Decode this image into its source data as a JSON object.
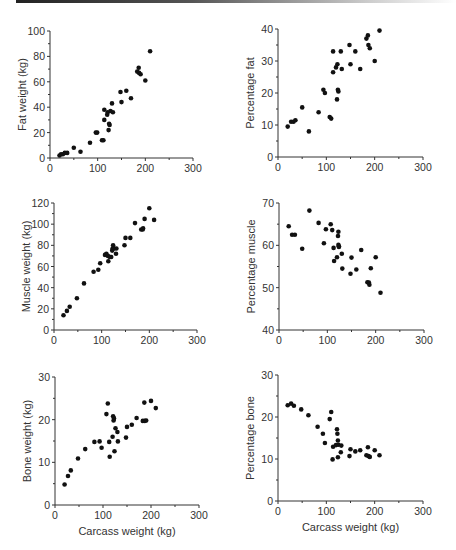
{
  "chart_data": [
    {
      "id": "fat-weight",
      "type": "scatter",
      "title": "",
      "xlabel": "",
      "ylabel": "Fat weight (kg)",
      "xlim": [
        0,
        300
      ],
      "ylim": [
        0,
        100
      ],
      "xticks": [
        0,
        100,
        200,
        300
      ],
      "yticks": [
        0,
        20,
        40,
        60,
        80,
        100
      ],
      "grid": false,
      "frame": {
        "x0": 50,
        "x1": 193,
        "y0": 158,
        "y1": 31
      },
      "x": [
        20,
        23,
        27,
        31,
        36,
        50,
        64,
        84,
        96,
        99,
        109,
        112,
        114,
        114,
        120,
        121,
        123,
        124,
        125,
        127,
        130,
        132,
        148,
        150,
        160,
        170,
        183,
        186,
        187,
        190,
        200,
        210
      ],
      "y": [
        2,
        3,
        3,
        4,
        4,
        8,
        5,
        12,
        20,
        20,
        14,
        14,
        38,
        30,
        34,
        36,
        22,
        27,
        26,
        37,
        43,
        36,
        52,
        44,
        53,
        47,
        68,
        71,
        67,
        66,
        61,
        84
      ]
    },
    {
      "id": "percentage-fat",
      "type": "scatter",
      "title": "",
      "xlabel": "",
      "ylabel": "Percentage fat",
      "xlim": [
        0,
        300
      ],
      "ylim": [
        0,
        40
      ],
      "xticks": [
        0,
        100,
        200,
        300
      ],
      "yticks": [
        0,
        10,
        20,
        30,
        40
      ],
      "grid": false,
      "frame": {
        "x0": 278,
        "x1": 423,
        "y0": 157,
        "y1": 29
      },
      "x": [
        20,
        27,
        32,
        36,
        50,
        64,
        84,
        94,
        97,
        107,
        110,
        114,
        114,
        120,
        122,
        123,
        124,
        125,
        130,
        132,
        148,
        150,
        160,
        170,
        183,
        186,
        187,
        190,
        200,
        210
      ],
      "y": [
        9.5,
        11,
        11,
        11.5,
        15.5,
        8,
        14,
        21,
        20,
        12.5,
        12,
        33,
        26.5,
        28,
        18,
        29,
        21,
        20.5,
        33,
        27.5,
        35,
        29,
        33,
        27.5,
        37,
        38,
        35,
        34,
        30,
        39.5
      ]
    },
    {
      "id": "muscle-weight",
      "type": "scatter",
      "title": "",
      "xlabel": "",
      "ylabel": "Muscle weight (kg)",
      "xlim": [
        0,
        300
      ],
      "ylim": [
        0,
        120
      ],
      "xticks": [
        0,
        100,
        200,
        300
      ],
      "yticks": [
        0,
        20,
        40,
        60,
        80,
        100,
        120
      ],
      "grid": false,
      "frame": {
        "x0": 54,
        "x1": 197,
        "y0": 330,
        "y1": 203
      },
      "x": [
        20,
        27,
        33,
        48,
        63,
        83,
        93,
        97,
        107,
        110,
        113,
        114,
        117,
        120,
        122,
        123,
        124,
        126,
        130,
        131,
        148,
        150,
        160,
        170,
        183,
        186,
        187,
        190,
        200,
        210
      ],
      "y": [
        14,
        18,
        22,
        30,
        44,
        55,
        57,
        63,
        71,
        72,
        70,
        65,
        69,
        69,
        75,
        77,
        80,
        77,
        72,
        77,
        80,
        87,
        87,
        101,
        95,
        95,
        96,
        105,
        115,
        104
      ]
    },
    {
      "id": "percentage-muscle",
      "type": "scatter",
      "title": "",
      "xlabel": "",
      "ylabel": "Percentage muscle",
      "xlim": [
        0,
        300
      ],
      "ylim": [
        40,
        70
      ],
      "xticks": [
        0,
        100,
        200,
        300
      ],
      "yticks": [
        40,
        50,
        60,
        70
      ],
      "grid": false,
      "frame": {
        "x0": 279,
        "x1": 424,
        "y0": 330,
        "y1": 203
      },
      "x": [
        20,
        27,
        33,
        48,
        63,
        82,
        93,
        97,
        107,
        110,
        113,
        114,
        120,
        122,
        123,
        123,
        124,
        124,
        130,
        131,
        148,
        150,
        160,
        170,
        183,
        186,
        187,
        190,
        200,
        210
      ],
      "y": [
        64.5,
        62.5,
        62.5,
        59.2,
        68.2,
        65.3,
        60.5,
        63.8,
        65,
        63.6,
        59.4,
        56.3,
        57.2,
        62.2,
        63.2,
        60.1,
        59.8,
        59.6,
        58,
        54.5,
        53.3,
        57.1,
        54.3,
        58.9,
        51.3,
        51.2,
        50.7,
        54.6,
        57.2,
        48.8
      ]
    },
    {
      "id": "bone-weight",
      "type": "scatter",
      "title": "",
      "xlabel": "Carcass weight (kg)",
      "ylabel": "Bone weight (kg)",
      "xlim": [
        0,
        300
      ],
      "ylim": [
        0,
        30
      ],
      "xticks": [
        0,
        100,
        200,
        300
      ],
      "yticks": [
        0,
        10,
        20,
        30
      ],
      "grid": false,
      "frame": {
        "x0": 55,
        "x1": 199,
        "y0": 505,
        "y1": 377
      },
      "x": [
        20,
        27,
        33,
        48,
        63,
        82,
        93,
        97,
        107,
        110,
        113,
        114,
        120,
        121,
        122,
        123,
        124,
        126,
        130,
        131,
        148,
        150,
        160,
        170,
        183,
        186,
        187,
        190,
        200,
        210
      ],
      "y": [
        4.8,
        6.8,
        8.1,
        10.9,
        13.1,
        14.8,
        14.9,
        13.4,
        21.3,
        23.8,
        14.8,
        11.3,
        16,
        20.8,
        19.8,
        20.3,
        12.6,
        18,
        17.1,
        14.9,
        15.8,
        18.3,
        18.8,
        20.4,
        19.7,
        24,
        19.7,
        19.8,
        24.4,
        22.7
      ]
    },
    {
      "id": "percentage-bone",
      "type": "scatter",
      "title": "",
      "xlabel": "Carcass weight (kg)",
      "ylabel": "Percentage bone",
      "xlim": [
        0,
        300
      ],
      "ylim": [
        0,
        30
      ],
      "xticks": [
        0,
        100,
        200,
        300
      ],
      "yticks": [
        0,
        10,
        20,
        30
      ],
      "grid": false,
      "frame": {
        "x0": 278,
        "x1": 423,
        "y0": 501,
        "y1": 375
      },
      "x": [
        20,
        27,
        33,
        48,
        63,
        82,
        93,
        97,
        107,
        110,
        113,
        114,
        120,
        122,
        123,
        124,
        124,
        125,
        130,
        131,
        148,
        150,
        160,
        170,
        183,
        186,
        187,
        190,
        200,
        210
      ],
      "y": [
        22.8,
        23.2,
        22.7,
        21.8,
        20.4,
        17.7,
        16,
        13.8,
        19.5,
        21.2,
        9.9,
        12.9,
        13.3,
        17.1,
        16,
        14.4,
        10.4,
        13.4,
        11.6,
        13.2,
        10.7,
        12.3,
        11.8,
        12.1,
        10.9,
        12.8,
        10.7,
        10.5,
        12.1,
        10.9
      ]
    }
  ]
}
